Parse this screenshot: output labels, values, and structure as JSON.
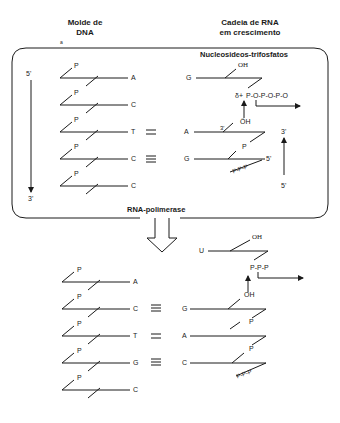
{
  "headers": {
    "template_title_line1": "Molde de",
    "template_title_line2": "DNA",
    "rna_title_line1": "Cadeia de RNA",
    "rna_title_line2": "em crescimento",
    "panel_mark": "a"
  },
  "top_panel": {
    "label_nucleotides": "Nucleosideos-trifosfatos",
    "label_enzyme": "RNA-polimerase",
    "strand_start": "5'",
    "strand_end": "3'",
    "rna_dir_top": "3'",
    "rna_dir_bottom": "5'",
    "dna_bases": [
      "A",
      "C",
      "T",
      "C",
      "C"
    ],
    "phosphate": "P",
    "pairs": [
      {
        "dna": "T",
        "bond": "=",
        "rna": "A"
      },
      {
        "dna": "C",
        "bond": "≡",
        "rna": "G"
      }
    ],
    "incoming": {
      "base": "G",
      "oh": "OH",
      "triphosphate": "P-O-P-O-P-O",
      "charge": "δ+"
    },
    "rna_3prime": "3'",
    "attacking_oh": "ÖH",
    "rna_5prime": "5'",
    "rna_5_triphosphate": "P-P-P"
  },
  "bottom_panel": {
    "dna_bases": [
      "A",
      "C",
      "T",
      "G",
      "C"
    ],
    "phosphate": "P",
    "pairs": [
      {
        "dna": "C",
        "bond": "≡",
        "rna": "G"
      },
      {
        "dna": "T",
        "bond": "=",
        "rna": "A"
      },
      {
        "dna": "G",
        "bond": "≡",
        "rna": "C"
      }
    ],
    "incoming": {
      "base": "U",
      "oh": "OH",
      "triphosphate": "P-P-P"
    },
    "attacking_oh": "OH",
    "rna_5_triphosphate": "P-P-P"
  }
}
